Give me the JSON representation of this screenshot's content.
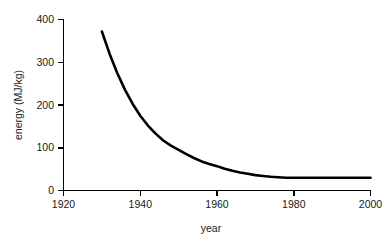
{
  "chart_data": {
    "type": "line",
    "title": "",
    "subtitle": "",
    "xlabel": "year",
    "ylabel": "energy  (MJ/kg)",
    "xlim": [
      1920,
      2000
    ],
    "ylim": [
      0,
      400
    ],
    "xticks": [
      1920,
      1940,
      1960,
      1980,
      2000
    ],
    "yticks": [
      0,
      100,
      200,
      300,
      400
    ],
    "xtick_labels": [
      "1920",
      "1940",
      "1960",
      "1980",
      "2000"
    ],
    "ytick_labels": [
      "0",
      "100",
      "200",
      "300",
      "400"
    ],
    "grid": false,
    "legend": false,
    "legend_position": "none",
    "series": [
      {
        "name": "energy",
        "color": "#000000",
        "marker": "none",
        "x": [
          1930,
          1932,
          1934,
          1936,
          1938,
          1940,
          1942,
          1944,
          1946,
          1948,
          1950,
          1952,
          1954,
          1956,
          1958,
          1960,
          1962,
          1964,
          1966,
          1968,
          1970,
          1972,
          1974,
          1976,
          1978,
          1980,
          1985,
          1990,
          1995,
          2000
        ],
        "values": [
          372,
          320,
          275,
          236,
          203,
          175,
          152,
          133,
          117,
          105,
          95,
          85,
          76,
          68,
          62,
          57,
          51,
          46,
          42,
          39,
          36,
          34,
          32,
          31,
          30,
          30,
          30,
          30,
          30,
          30
        ]
      }
    ],
    "annotations": []
  },
  "axes": {
    "x_axis_label": "year",
    "y_axis_label": "energy  (MJ/kg)"
  },
  "figure": {
    "background_color": "#ffffff",
    "foreground_color": "#000000"
  }
}
